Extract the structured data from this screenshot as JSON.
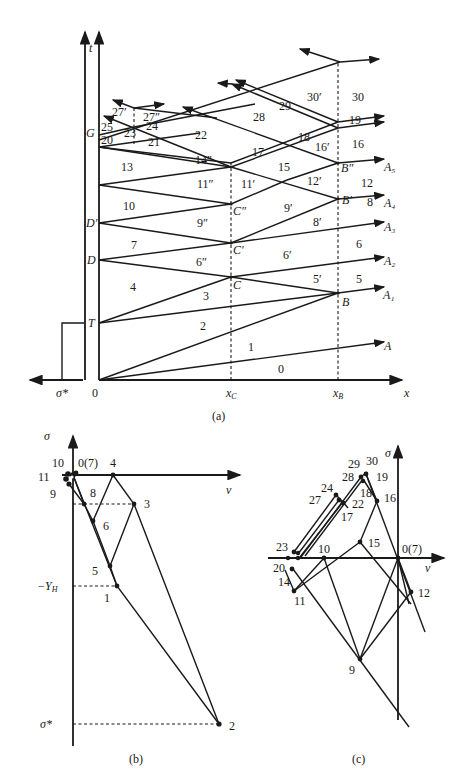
{
  "figure": {
    "panels": {
      "a": {
        "caption": "(a)",
        "axes": {
          "t_label": "t",
          "x_label": "x",
          "origin": "0",
          "load_label": "σ*"
        },
        "x_ticks": [
          "x_C",
          "x_B"
        ],
        "t_points": [
          "T",
          "D",
          "D′",
          "G"
        ],
        "intersection_points": [
          "C",
          "C′",
          "C″",
          "B",
          "B′",
          "B″"
        ],
        "outgoing_waves": [
          "A",
          "A₁",
          "A₂",
          "A₃",
          "A₄",
          "A₅"
        ],
        "region_labels": [
          "0",
          "1",
          "2",
          "3",
          "4",
          "5",
          "5′",
          "6",
          "6′",
          "6″",
          "7",
          "8",
          "8′",
          "9′",
          "9″",
          "10",
          "11′",
          "11″",
          "12",
          "12′",
          "13",
          "14″",
          "15",
          "16",
          "16′",
          "17",
          "18",
          "19",
          "20",
          "21",
          "22",
          "23",
          "24",
          "25",
          "27′",
          "27″",
          "28",
          "29",
          "30",
          "30′"
        ]
      },
      "b": {
        "caption": "(b)",
        "axes": {
          "y_label": "σ",
          "x_label": "v"
        },
        "y_ticks": [
          "−Y_H",
          "σ*"
        ],
        "state_points": [
          "0(7)",
          "1",
          "2",
          "3",
          "4",
          "5",
          "6",
          "8",
          "9",
          "10",
          "11"
        ]
      },
      "c": {
        "caption": "(c)",
        "axes": {
          "y_label": "σ",
          "x_label": "v"
        },
        "state_points": [
          "0(7)",
          "9",
          "10",
          "11",
          "12",
          "14",
          "15",
          "16",
          "17",
          "18",
          "19",
          "20",
          "22",
          "23",
          "24",
          "27",
          "28",
          "29",
          "30"
        ]
      }
    }
  },
  "labels": {
    "t": "t",
    "x": "x",
    "zero": "0",
    "sigstar": "σ*",
    "xC": "x",
    "xCsub": "C",
    "xB": "x",
    "xBsub": "B",
    "T": "T",
    "D": "D",
    "Dp": "D′",
    "G": "G",
    "C": "C",
    "Cp": "C′",
    "Cpp": "C″",
    "B": "B",
    "Bp": "B′",
    "Bpp": "B″",
    "A": "A",
    "A1": "A₁",
    "A2": "A₂",
    "A3": "A₃",
    "A4": "A₄",
    "A5": "A₅",
    "r0": "0",
    "r1": "1",
    "r2": "2",
    "r3": "3",
    "r4": "4",
    "r5": "5",
    "r5p": "5′",
    "r6": "6",
    "r6p": "6′",
    "r6pp": "6″",
    "r7": "7",
    "r8": "8",
    "r8p": "8′",
    "r9p": "9′",
    "r9pp": "9″",
    "r10": "10",
    "r11p": "11′",
    "r11pp": "11″",
    "r12": "12",
    "r12p": "12′",
    "r13": "13",
    "r14pp": "14″",
    "r15": "15",
    "r16": "16",
    "r16p": "16′",
    "r17": "17",
    "r18": "18",
    "r19": "19",
    "r20": "20",
    "r21": "21",
    "r22": "22",
    "r23": "23",
    "r24": "24",
    "r25": "25",
    "r27p": "27′",
    "r27pp": "27″",
    "r28": "28",
    "r29": "29",
    "r30": "30",
    "r30p": "30′",
    "capA": "(a)",
    "capB": "(b)",
    "capC": "(c)",
    "sigma": "σ",
    "v": "v",
    "YH": "−Y",
    "YHsub": "H",
    "b0": "0(7)",
    "b1": "1",
    "b2": "2",
    "b3": "3",
    "b4": "4",
    "b5": "5",
    "b6": "6",
    "b8": "8",
    "b9": "9",
    "b10": "10",
    "b11": "11",
    "c0": "0(7)",
    "c9": "9",
    "c10": "10",
    "c11": "11",
    "c12": "12",
    "c14": "14",
    "c15": "15",
    "c16": "16",
    "c17": "17",
    "c18": "18",
    "c19": "19",
    "c20": "20",
    "c22": "22",
    "c23": "23",
    "c24": "24",
    "c27": "27",
    "c28": "28",
    "c29": "29",
    "c30": "30"
  }
}
